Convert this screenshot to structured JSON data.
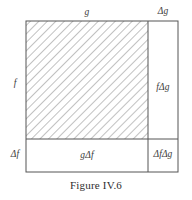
{
  "figure": {
    "caption": "Figure IV.6",
    "type": "product-rule-area-diagram",
    "line_color": "#555555",
    "hatch_color": "#8d8d8d",
    "background": "#ffffff",
    "labels": {
      "top_main": "g",
      "top_right": "Δg",
      "left_main": "f",
      "right_cell": "fΔg",
      "bottom_left": "Δf",
      "bottom_cell": "gΔf",
      "corner_cell": "ΔfΔg"
    },
    "geometry": {
      "outer_left": 26,
      "outer_top": 21,
      "outer_right": 178,
      "outer_bottom": 172,
      "split_x": 148,
      "split_y": 139,
      "hatch_angle_deg": 45,
      "hatch_spacing": 6
    }
  }
}
